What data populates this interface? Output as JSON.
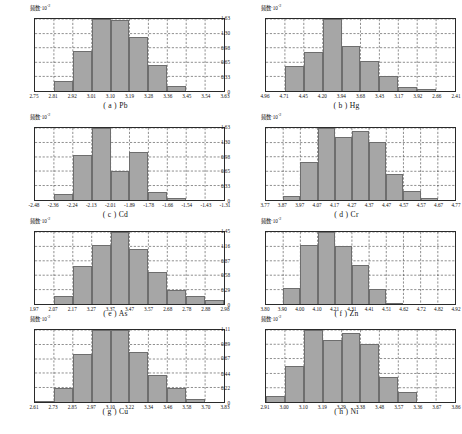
{
  "figure": {
    "y_axis_label_text": "频数·10",
    "y_axis_label_exp": "-2"
  },
  "chart_data": [
    {
      "id": "a",
      "type": "bar",
      "title": "( a ) Pb",
      "element": "Pb",
      "xlabel": "",
      "ylabel": "频数·10⁻²",
      "ylim": [
        0,
        1.38
      ],
      "yticks": [
        "0",
        "0.28",
        "0.55",
        "0.83",
        "1.10",
        "1.38"
      ],
      "ytick_values": [
        0,
        0.28,
        0.55,
        0.83,
        1.1,
        1.38
      ],
      "xticks": [
        "2.75",
        "2.81",
        "2.92",
        "3.01",
        "3.10",
        "3.19",
        "3.28",
        "3.36",
        "3.45",
        "3.54",
        "3.63"
      ],
      "bin_edges": [
        2.75,
        2.81,
        2.92,
        3.01,
        3.1,
        3.19,
        3.28,
        3.36,
        3.45,
        3.54,
        3.63
      ],
      "values": [
        0,
        0.19,
        0.77,
        1.38,
        1.36,
        1.03,
        0.5,
        0.1,
        0,
        0
      ],
      "grid": true
    },
    {
      "id": "b",
      "type": "bar",
      "title": "( b ) Hg",
      "element": "Hg",
      "xlabel": "",
      "ylabel": "频数·10⁻²",
      "ylim": [
        0,
        1.63
      ],
      "yticks": [
        "0",
        "0.33",
        "0.65",
        "0.98",
        "1.30",
        "1.63"
      ],
      "ytick_values": [
        0,
        0.33,
        0.65,
        0.98,
        1.3,
        1.63
      ],
      "xticks": [
        "4.96",
        "4.71",
        "4.45",
        "4.20",
        "3.94",
        "3.68",
        "3.43",
        "3.17",
        "3.92",
        "2.66",
        "2.41"
      ],
      "bin_edges": [
        4.96,
        4.71,
        4.45,
        4.2,
        3.94,
        3.68,
        3.43,
        3.17,
        2.92,
        2.66,
        2.41
      ],
      "values": [
        0,
        0.57,
        0.88,
        1.63,
        1.02,
        0.68,
        0.34,
        0.1,
        0.04,
        0
      ],
      "grid": true
    },
    {
      "id": "c",
      "type": "bar",
      "title": "( c ) Cd",
      "element": "Cd",
      "xlabel": "",
      "ylabel": "频数·10⁻²",
      "ylim": [
        0,
        1.79
      ],
      "yticks": [
        "0",
        "0.36",
        "0.72",
        "1.07",
        "1.43",
        "1.79"
      ],
      "ytick_values": [
        0,
        0.36,
        0.72,
        1.07,
        1.43,
        1.79
      ],
      "xticks": [
        "-2.48",
        "-2.36",
        "-2.24",
        "-2.13",
        "-2.01",
        "-1.89",
        "-1.78",
        "-1.66",
        "-1.54",
        "-1.43",
        "-1.31"
      ],
      "bin_edges": [
        -2.48,
        -2.36,
        -2.24,
        -2.13,
        -2.01,
        -1.89,
        -1.78,
        -1.66,
        -1.54,
        -1.43,
        -1.31
      ],
      "values": [
        0,
        0.14,
        1.12,
        1.79,
        0.72,
        1.19,
        0.21,
        0.05,
        0,
        0
      ],
      "grid": true
    },
    {
      "id": "d",
      "type": "bar",
      "title": "( d ) Cr",
      "element": "Cr",
      "xlabel": "",
      "ylabel": "频数·10⁻²",
      "ylim": [
        0,
        1.63
      ],
      "yticks": [
        "0",
        "0.33",
        "0.65",
        "0.98",
        "1.30",
        "1.63"
      ],
      "ytick_values": [
        0,
        0.33,
        0.65,
        0.98,
        1.3,
        1.63
      ],
      "xticks": [
        "3.77",
        "3.87",
        "3.97",
        "4.07",
        "4.17",
        "4.27",
        "4.37",
        "4.47",
        "4.57",
        "4.57",
        "4.67",
        "4.77"
      ],
      "bin_edges": [
        3.77,
        3.87,
        3.97,
        4.07,
        4.17,
        4.27,
        4.37,
        4.47,
        4.57,
        4.62,
        4.67,
        4.77
      ],
      "values": [
        0,
        0.1,
        0.86,
        1.63,
        1.42,
        1.56,
        1.32,
        0.58,
        0.2,
        0.04,
        0
      ],
      "grid": true
    },
    {
      "id": "e",
      "type": "bar",
      "title": "( e ) As",
      "element": "As",
      "xlabel": "",
      "ylabel": "频数·10⁻²",
      "ylim": [
        0,
        1.3
      ],
      "yticks": [
        "0",
        "0.26",
        "0.52",
        "0.78",
        "1.04",
        "1.30"
      ],
      "ytick_values": [
        0,
        0.26,
        0.52,
        0.78,
        1.04,
        1.3
      ],
      "xticks": [
        "1.97",
        "2.07",
        "2.17",
        "3.27",
        "3.37",
        "3.47",
        "3.57",
        "2.68",
        "2.78",
        "2.88",
        "2.98"
      ],
      "bin_edges": [
        1.97,
        2.07,
        2.17,
        2.27,
        2.37,
        2.47,
        2.57,
        2.68,
        2.78,
        2.88,
        2.98
      ],
      "values": [
        0,
        0.15,
        0.68,
        1.06,
        1.3,
        0.99,
        0.58,
        0.26,
        0.15,
        0.07
      ],
      "grid": true
    },
    {
      "id": "f",
      "type": "bar",
      "title": "( f ) Zn",
      "element": "Zn",
      "xlabel": "",
      "ylabel": "频数·10⁻²",
      "ylim": [
        0,
        1.45
      ],
      "yticks": [
        "0",
        "0.29",
        "0.58",
        "0.87",
        "1.16",
        "1.45"
      ],
      "ytick_values": [
        0,
        0.29,
        0.58,
        0.87,
        1.16,
        1.45
      ],
      "xticks": [
        "3.80",
        "3.90",
        "4.00",
        "4.10",
        "4.21",
        "4.31",
        "4.41",
        "4.51",
        "4.62",
        "4.72",
        "4.82",
        "4.92"
      ],
      "bin_edges": [
        3.8,
        3.9,
        4.0,
        4.1,
        4.21,
        4.31,
        4.41,
        4.51,
        4.62,
        4.72,
        4.82,
        4.92
      ],
      "values": [
        0,
        0.32,
        1.19,
        1.45,
        1.17,
        0.79,
        0.31,
        0.02,
        0,
        0,
        0
      ],
      "grid": true
    },
    {
      "id": "g",
      "type": "bar",
      "title": "( g ) Cu",
      "element": "Cu",
      "xlabel": "",
      "ylabel": "频数·10⁻²",
      "ylim": [
        0,
        1.29
      ],
      "yticks": [
        "0",
        "0.26",
        "0.52",
        "0.77",
        "1.03",
        "1.29"
      ],
      "ytick_values": [
        0,
        0.26,
        0.52,
        0.77,
        1.03,
        1.29
      ],
      "xticks": [
        "2.61",
        "2.73",
        "2.85",
        "2.97",
        "3.10",
        "3.22",
        "3.34",
        "3.46",
        "3.58",
        "3.70",
        "3.83"
      ],
      "bin_edges": [
        2.61,
        2.73,
        2.85,
        2.97,
        3.1,
        3.22,
        3.34,
        3.46,
        3.58,
        3.7,
        3.83
      ],
      "values": [
        0.01,
        0.26,
        0.86,
        1.29,
        1.29,
        0.9,
        0.48,
        0.26,
        0.05,
        0
      ],
      "grid": true
    },
    {
      "id": "h",
      "type": "bar",
      "title": "( h ) Ni",
      "element": "Ni",
      "xlabel": "",
      "ylabel": "频数·10⁻²",
      "ylim": [
        0,
        1.11
      ],
      "yticks": [
        "0",
        "0.22",
        "0.44",
        "0.67",
        "0.89",
        "1.11"
      ],
      "ytick_values": [
        0,
        0.22,
        0.44,
        0.67,
        0.89,
        1.11
      ],
      "xticks": [
        "2.91",
        "3.00",
        "3.10",
        "3.19",
        "3.29",
        "3.38",
        "3.48",
        "3.57",
        "3.36",
        "3.67",
        "3.86"
      ],
      "bin_edges": [
        2.91,
        3.0,
        3.1,
        3.19,
        3.29,
        3.38,
        3.48,
        3.57,
        3.67,
        3.76,
        3.86
      ],
      "values": [
        0.09,
        0.56,
        1.11,
        0.96,
        1.06,
        0.89,
        0.39,
        0.16,
        0,
        0
      ],
      "grid": true
    }
  ]
}
